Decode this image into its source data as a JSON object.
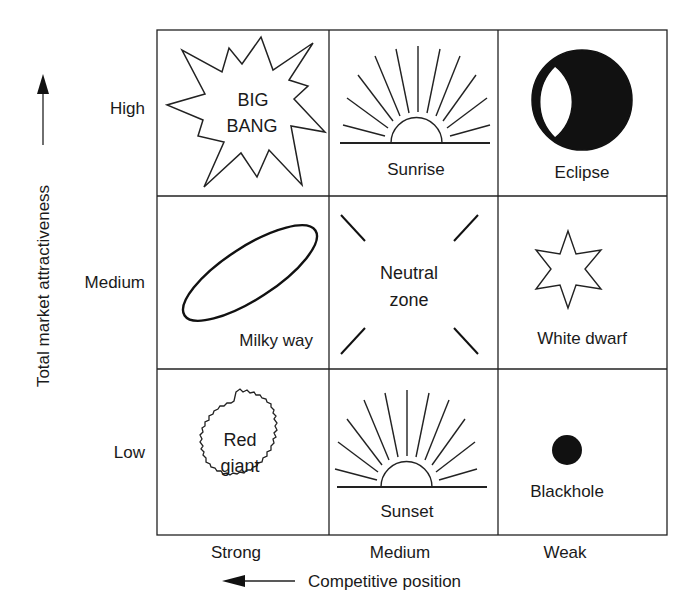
{
  "diagram": {
    "type": "3x3 matrix",
    "y_axis": {
      "title": "Total market attractiveness",
      "levels": [
        "High",
        "Medium",
        "Low"
      ]
    },
    "x_axis": {
      "title": "Competitive position",
      "levels": [
        "Strong",
        "Medium",
        "Weak"
      ]
    },
    "cells": [
      {
        "row": "High",
        "col": "Strong",
        "label_line1": "BIG",
        "label_line2": "BANG",
        "icon": "starburst-icon"
      },
      {
        "row": "High",
        "col": "Medium",
        "label": "Sunrise",
        "icon": "sunrise-icon"
      },
      {
        "row": "High",
        "col": "Weak",
        "label": "Eclipse",
        "icon": "eclipse-icon"
      },
      {
        "row": "Medium",
        "col": "Strong",
        "label": "Milky way",
        "icon": "ellipse-galaxy-icon"
      },
      {
        "row": "Medium",
        "col": "Medium",
        "label_line1": "Neutral",
        "label_line2": "zone",
        "icon": "four-diagonal-lines-icon"
      },
      {
        "row": "Medium",
        "col": "Weak",
        "label": "White dwarf",
        "icon": "six-point-star-icon"
      },
      {
        "row": "Low",
        "col": "Strong",
        "label_line1": "Red",
        "label_line2": "giant",
        "icon": "fuzzy-circle-icon"
      },
      {
        "row": "Low",
        "col": "Medium",
        "label": "Sunset",
        "icon": "sunset-icon"
      },
      {
        "row": "Low",
        "col": "Weak",
        "label": "Blackhole",
        "icon": "filled-dot-icon"
      }
    ]
  }
}
